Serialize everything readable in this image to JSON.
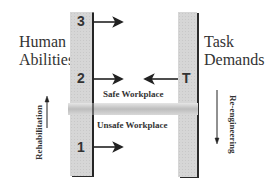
{
  "left_label": {
    "line1": "Human",
    "line2": "Abilities"
  },
  "right_label": {
    "line1": "Task",
    "line2": "Demands"
  },
  "left_column": {
    "levels": [
      {
        "label": "3"
      },
      {
        "label": "2"
      },
      {
        "label": "1"
      }
    ]
  },
  "right_column": {
    "marker": "T"
  },
  "zones": {
    "safe": "Safe Workplace",
    "unsafe": "Unsafe Workplace"
  },
  "left_axis": {
    "label": "Rehabilitation",
    "direction": "up"
  },
  "right_axis": {
    "label": "Re-engineering",
    "direction": "down"
  },
  "colors": {
    "column_fill": "#d6d6d6",
    "column_shadow": "#2a2a2a",
    "bar": "#c4c4c4",
    "text": "#333333"
  }
}
